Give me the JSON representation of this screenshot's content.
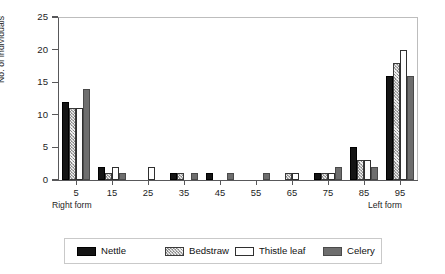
{
  "chart_data": {
    "type": "bar",
    "title": "",
    "subtitle": "",
    "xlabel": "",
    "ylabel": "No. of individuals",
    "ylim": [
      0,
      25
    ],
    "ytick_values": [
      0,
      5,
      10,
      15,
      20,
      25
    ],
    "ytick_labels": [
      "0",
      "5",
      "10",
      "15",
      "20",
      "25"
    ],
    "categories": [
      "5",
      "15",
      "25",
      "35",
      "45",
      "55",
      "65",
      "75",
      "85",
      "95"
    ],
    "grid": false,
    "legend_position": "bottom",
    "annotations": [
      {
        "text": "Right form",
        "position": "below-axis-left"
      },
      {
        "text": "Left form",
        "position": "below-axis-right"
      }
    ],
    "series": [
      {
        "name": "Nettle",
        "color": "#141414",
        "pattern": "solid-black",
        "values": [
          12,
          2,
          0,
          1,
          1,
          0,
          0,
          1,
          5,
          16
        ]
      },
      {
        "name": "Bedstraw",
        "color": "#b5b5b5",
        "pattern": "hatched",
        "values": [
          11,
          1,
          0,
          1,
          0,
          0,
          1,
          1,
          3,
          18
        ]
      },
      {
        "name": "Thistle leaf",
        "color": "#fdfdfd",
        "pattern": "open-white",
        "values": [
          11,
          2,
          2,
          0,
          0,
          0,
          1,
          1,
          3,
          20
        ]
      },
      {
        "name": "Celery",
        "color": "#6e6e6e",
        "pattern": "solid-gray",
        "values": [
          14,
          1,
          0,
          1,
          1,
          1,
          0,
          2,
          2,
          16
        ]
      }
    ]
  },
  "legend": {
    "items": [
      {
        "label": "Nettle"
      },
      {
        "label": "Bedstraw"
      },
      {
        "label": "Thistle leaf"
      },
      {
        "label": "Celery"
      }
    ]
  }
}
